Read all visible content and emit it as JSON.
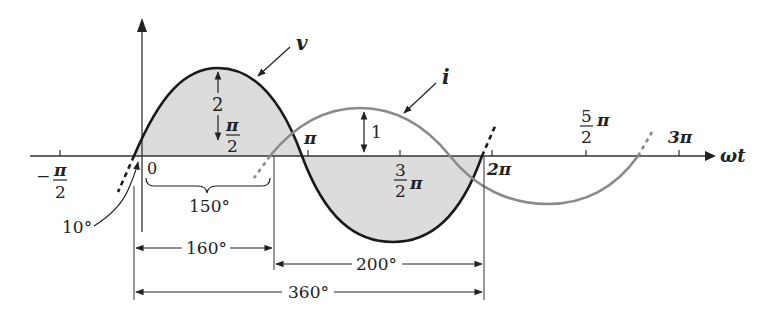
{
  "colors": {
    "axis": "#333333",
    "v_curve": "#1a1a1a",
    "i_curve": "#8a8a8a",
    "fill": "#d9d9d9",
    "text": "#222222"
  },
  "axis": {
    "x_label": "ωt",
    "ticks": [
      {
        "id": "neg_half_pi",
        "num": "π",
        "den": "2",
        "prefix": "−"
      },
      {
        "id": "zero",
        "text": "0"
      },
      {
        "id": "pi",
        "text": "π"
      },
      {
        "id": "three_half_pi",
        "num": "3",
        "den": "2",
        "suffix": "π"
      },
      {
        "id": "two_pi",
        "text": "2π"
      },
      {
        "id": "five_half_pi",
        "num": "5",
        "den": "2",
        "suffix": "π"
      },
      {
        "id": "three_pi",
        "text": "3π"
      }
    ]
  },
  "curves": {
    "v_label": "v",
    "i_label": "i"
  },
  "annotations": {
    "v_amplitude": "2",
    "v_peak_position_num": "π",
    "v_peak_position_den": "2",
    "i_amplitude": "1",
    "brace_label": "150°",
    "offset_label": "10°",
    "dim_160": "160°",
    "dim_200": "200°",
    "dim_360": "360°"
  }
}
